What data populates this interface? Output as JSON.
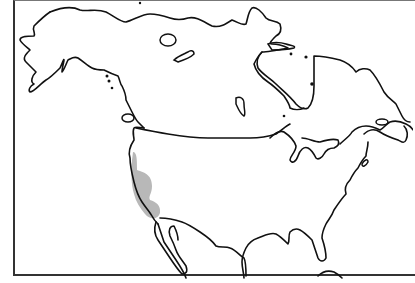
{
  "map": {
    "region": "North America",
    "type": "species range map",
    "range_region": "Pacific coast of California",
    "colors": {
      "range_fill": "#b8b8b8",
      "coastline": "#111111",
      "frame": "#333333",
      "background": "#ffffff"
    }
  }
}
